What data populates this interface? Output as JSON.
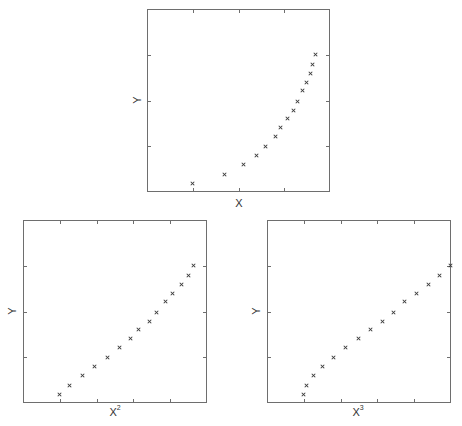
{
  "chart_data": [
    {
      "type": "scatter",
      "title": "",
      "xlabel": "X",
      "ylabel": "Y",
      "grid": false,
      "legend": null,
      "marker": "x",
      "axis_normalized": true,
      "x_ticks_normalized": [
        0.25,
        0.5,
        0.75
      ],
      "y_ticks_normalized": [
        0.25,
        0.5,
        0.75
      ],
      "tick_labels": [],
      "frame_px": {
        "left": 147,
        "top": 9,
        "width": 183,
        "height": 183
      },
      "label_px": {
        "x": {
          "left": 239,
          "top": 197
        },
        "y": {
          "left": 137,
          "top": 100
        }
      },
      "x": [
        0.251,
        0.421,
        0.525,
        0.596,
        0.65,
        0.7,
        0.732,
        0.77,
        0.798,
        0.825,
        0.847,
        0.869,
        0.891,
        0.907,
        0.923
      ],
      "y": [
        0.049,
        0.098,
        0.148,
        0.197,
        0.251,
        0.301,
        0.35,
        0.399,
        0.448,
        0.497,
        0.552,
        0.601,
        0.65,
        0.699,
        0.749
      ]
    },
    {
      "type": "scatter",
      "title": "",
      "xlabel": "X",
      "xlabel_sup": "2",
      "ylabel": "Y",
      "grid": false,
      "legend": null,
      "marker": "x",
      "axis_normalized": true,
      "x_ticks_normalized": [
        0.2,
        0.4,
        0.6,
        0.8
      ],
      "y_ticks_normalized": [
        0.25,
        0.5,
        0.75
      ],
      "tick_labels": [],
      "frame_px": {
        "left": 23,
        "top": 220,
        "width": 184,
        "height": 183
      },
      "label_px": {
        "x": {
          "left": 115,
          "top": 406
        },
        "y": {
          "left": 12,
          "top": 311
        }
      },
      "x": [
        0.201,
        0.25,
        0.321,
        0.391,
        0.457,
        0.522,
        0.582,
        0.63,
        0.685,
        0.728,
        0.772,
        0.815,
        0.859,
        0.897,
        0.929
      ],
      "y": [
        0.049,
        0.098,
        0.148,
        0.197,
        0.251,
        0.301,
        0.35,
        0.399,
        0.448,
        0.497,
        0.552,
        0.601,
        0.65,
        0.699,
        0.749
      ]
    },
    {
      "type": "scatter",
      "title": "",
      "xlabel": "X",
      "xlabel_sup": "3",
      "ylabel": "Y",
      "grid": false,
      "legend": null,
      "marker": "x",
      "axis_normalized": true,
      "x_ticks_normalized": [
        0.2,
        0.4,
        0.6,
        0.8
      ],
      "y_ticks_normalized": [
        0.25,
        0.5,
        0.75
      ],
      "tick_labels": [],
      "frame_px": {
        "left": 267,
        "top": 220,
        "width": 184,
        "height": 183
      },
      "label_px": {
        "x": {
          "left": 358,
          "top": 406
        },
        "y": {
          "left": 256,
          "top": 311
        }
      },
      "x": [
        0.201,
        0.217,
        0.255,
        0.304,
        0.364,
        0.429,
        0.495,
        0.56,
        0.625,
        0.685,
        0.745,
        0.81,
        0.875,
        0.935,
        0.995
      ],
      "y": [
        0.049,
        0.098,
        0.148,
        0.197,
        0.251,
        0.301,
        0.35,
        0.399,
        0.448,
        0.497,
        0.552,
        0.601,
        0.65,
        0.699,
        0.749
      ]
    }
  ],
  "colors": {
    "frame": "#6e6e6e",
    "marker": "#3a3a3a",
    "text": "#333333",
    "background": "#ffffff"
  }
}
